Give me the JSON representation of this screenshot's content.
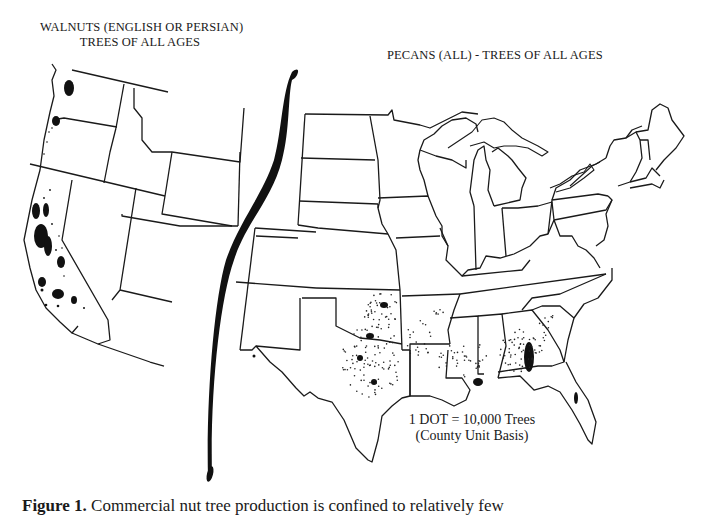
{
  "figure": {
    "walnut_map": {
      "title_line1": "WALNUTS (ENGLISH OR PERSIAN)",
      "title_line2": "TREES OF ALL AGES",
      "concentrations": [
        "Washington (Puget Sound)",
        "Oregon (Willamette Valley)",
        "California (Sacramento & San Joaquin Valleys)",
        "California (coastal south)"
      ]
    },
    "pecan_map": {
      "title": "PECANS (ALL) - TREES OF ALL AGES",
      "concentrations": [
        "Oklahoma",
        "Texas",
        "Louisiana",
        "Mississippi",
        "Alabama",
        "Georgia",
        "South Carolina",
        "New Mexico"
      ]
    },
    "legend": {
      "line1": "1 DOT = 10,000 Trees",
      "line2": "(County Unit Basis)"
    },
    "caption": {
      "label": "Figure 1.",
      "text": "Commercial nut tree production is confined to relatively few"
    },
    "colors": {
      "ink": "#1a1a1a",
      "paper": "#ffffff"
    }
  }
}
